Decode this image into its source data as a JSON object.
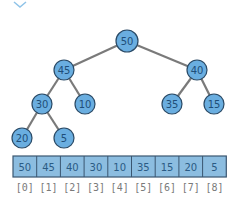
{
  "diagram": {
    "colors": {
      "node_fill": "#6aaee0",
      "node_stroke": "#2a4a66",
      "edge": "#7a7a7a",
      "cell_fill": "#8cbde0",
      "cell_stroke": "#3a5670",
      "index_text": "#7a7a7a",
      "node_text": "#1f4e79"
    },
    "nodes": [
      {
        "id": 0,
        "value": "50",
        "x": 127,
        "y": 41,
        "r": 11
      },
      {
        "id": 1,
        "value": "45",
        "x": 64,
        "y": 70,
        "r": 10
      },
      {
        "id": 2,
        "value": "40",
        "x": 197,
        "y": 70,
        "r": 10
      },
      {
        "id": 3,
        "value": "30",
        "x": 42,
        "y": 104,
        "r": 10
      },
      {
        "id": 4,
        "value": "10",
        "x": 85,
        "y": 104,
        "r": 10
      },
      {
        "id": 5,
        "value": "35",
        "x": 172,
        "y": 104,
        "r": 10
      },
      {
        "id": 6,
        "value": "15",
        "x": 214,
        "y": 104,
        "r": 10
      },
      {
        "id": 7,
        "value": "20",
        "x": 22,
        "y": 138,
        "r": 10
      },
      {
        "id": 8,
        "value": "5",
        "x": 64,
        "y": 138,
        "r": 10
      }
    ],
    "edges": [
      [
        0,
        1
      ],
      [
        0,
        2
      ],
      [
        1,
        3
      ],
      [
        1,
        4
      ],
      [
        2,
        5
      ],
      [
        2,
        6
      ],
      [
        3,
        7
      ],
      [
        3,
        8
      ]
    ],
    "array": {
      "x": 13,
      "y": 156,
      "cell_width": 23.7,
      "cell_height": 21,
      "values": [
        "50",
        "45",
        "40",
        "30",
        "10",
        "35",
        "15",
        "20",
        "5"
      ],
      "indices": [
        "[0]",
        "[1]",
        "[2]",
        "[3]",
        "[4]",
        "[5]",
        "[6]",
        "[7]",
        "[8]"
      ],
      "index_y": 187
    }
  }
}
